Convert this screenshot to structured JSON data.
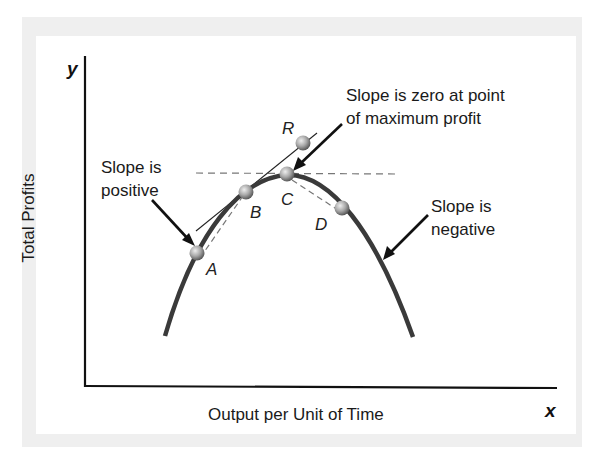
{
  "figure": {
    "axes": {
      "x_var": "x",
      "y_var": "y",
      "x_label": "Output per Unit of Time",
      "y_label": "Total Profits"
    },
    "points": {
      "A": "A",
      "B": "B",
      "C": "C",
      "D": "D",
      "R": "R"
    },
    "annotations": {
      "positive_line1": "Slope is",
      "positive_line2": "positive",
      "zero_line1": "Slope is zero at point",
      "zero_line2": "of maximum profit",
      "negative_line1": "Slope is",
      "negative_line2": "negative"
    },
    "colors": {
      "curve": "#3a3a3a",
      "frame": "#efefef",
      "point_fill": "#9a9a9a",
      "text": "#1a1a1a"
    }
  }
}
